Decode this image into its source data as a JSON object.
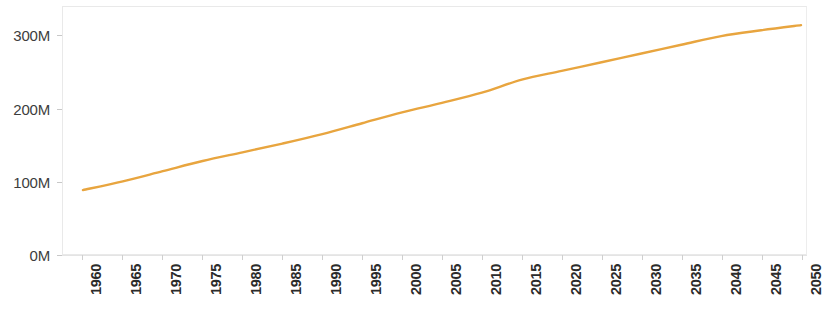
{
  "chart_data": {
    "type": "line",
    "title": "",
    "subtitle": "",
    "xlabel": "",
    "ylabel": "",
    "xlim": [
      1960,
      2050
    ],
    "ylim": [
      0,
      340
    ],
    "grid": false,
    "legend": "none",
    "line_color": "#e8a53f",
    "x": [
      1960,
      1965,
      1970,
      1975,
      1980,
      1985,
      1990,
      1995,
      2000,
      2005,
      2010,
      2015,
      2020,
      2025,
      2030,
      2035,
      2040,
      2045,
      2050
    ],
    "y_unit": "millions",
    "values": [
      88,
      100,
      114,
      128,
      140,
      152,
      165,
      180,
      195,
      208,
      222,
      240,
      252,
      264,
      276,
      288,
      300,
      308,
      315
    ],
    "series": [
      {
        "name": "Population",
        "color": "#e8a53f",
        "values": [
          88,
          100,
          114,
          128,
          140,
          152,
          165,
          180,
          195,
          208,
          222,
          240,
          252,
          264,
          276,
          288,
          300,
          308,
          315
        ]
      }
    ],
    "y_ticks": [
      0,
      100,
      200,
      300
    ],
    "y_tick_labels": [
      "0M",
      "100M",
      "200M",
      "300M"
    ],
    "x_tick_labels": [
      "1960",
      "1965",
      "1970",
      "1975",
      "1980",
      "1985",
      "1990",
      "1995",
      "2000",
      "2005",
      "2010",
      "2015",
      "2020",
      "2025",
      "2030",
      "2035",
      "2040",
      "2045",
      "2050"
    ],
    "axis_colors": {
      "plot_border": "#e9e9e9",
      "tick_text": "#2b2b2b",
      "y_tick_text": "#3d3d3d"
    }
  }
}
